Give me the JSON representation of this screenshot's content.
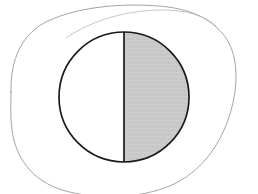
{
  "figure": {
    "title": "Half-shaded circle inside a hand-drawn outline",
    "background_color": "#ffffff",
    "canvas": {
      "width": 258,
      "height": 194
    }
  },
  "blob": {
    "name": "hand-drawn outline",
    "stroke_color": "#9a9a9a",
    "stroke_width": 0.9,
    "fill": "none",
    "secondary_stroke_color": "#b6b6b6",
    "secondary_stroke_width": 0.8,
    "path": "M 11 92 C 10 60, 22 33, 48 21 C 78 7, 120 3, 158 6 C 188 8, 212 18, 226 38 C 240 59, 238 92, 228 120 C 218 148, 200 172, 172 185 C 140 199, 96 200, 62 190 C 34 181, 16 160, 12 130 C 10 116, 11 104, 11 92 Z",
    "overlay_path": "M 66 38 C 92 20, 128 10, 162 10 C 186 10, 204 15, 216 26"
  },
  "circle": {
    "name": "circle",
    "center_x": 124,
    "center_y": 97,
    "radius": 65,
    "stroke_color": "#1a1a1a",
    "stroke_width": 1.7,
    "left_half_fill": "#ffffff",
    "right_half_fill": "#c9c9c9"
  },
  "diameter": {
    "name": "vertical diameter",
    "x": 124,
    "y_top": 32,
    "y_bottom": 162,
    "stroke_color": "#1a1a1a",
    "stroke_width": 1.7
  },
  "shading": {
    "shaded_half": "right",
    "unshaded_half": "left",
    "shaded_fraction": "1/2",
    "shaded_color": "#c9c9c9",
    "unshaded_color": "#ffffff"
  },
  "chart_data": {
    "type": "pie",
    "title": "",
    "categories": [
      "shaded",
      "unshaded"
    ],
    "values": [
      50,
      50
    ],
    "labels": [
      "",
      ""
    ],
    "colors": [
      "#c9c9c9",
      "#ffffff"
    ],
    "legend": "none",
    "grid": false,
    "start_angle": 90
  }
}
